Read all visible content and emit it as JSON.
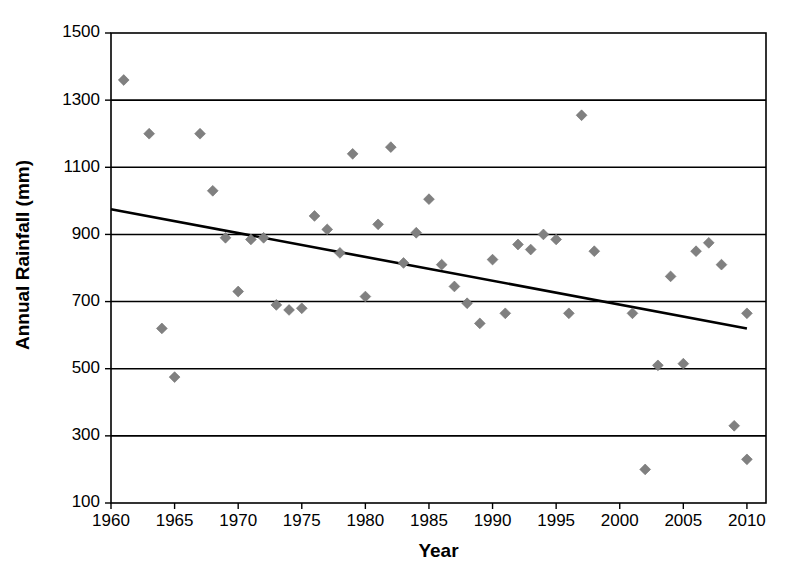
{
  "chart_data": {
    "type": "scatter",
    "title": "",
    "xlabel": "Year",
    "ylabel": "Annual Rainfall (mm)",
    "xlim": [
      1960,
      2011.5
    ],
    "ylim": [
      100,
      1500
    ],
    "xticks": [
      1960,
      1965,
      1970,
      1975,
      1980,
      1985,
      1990,
      1995,
      2000,
      2005,
      2010
    ],
    "yticks": [
      100,
      300,
      500,
      700,
      900,
      1100,
      1300,
      1500
    ],
    "xtick_labels": [
      "1960",
      "1965",
      "1970",
      "1975",
      "1980",
      "1985",
      "1990",
      "1995",
      "2000",
      "2005",
      "2010"
    ],
    "ytick_labels": [
      "100",
      "300",
      "500",
      "700",
      "900",
      "1100",
      "1300",
      "1500"
    ],
    "grid": "horizontal",
    "legend": "none",
    "marker_shape": "diamond",
    "marker_color": "#808080",
    "series": [
      {
        "name": "Annual Rainfall",
        "points": [
          [
            1961,
            1360
          ],
          [
            1963,
            1200
          ],
          [
            1964,
            620
          ],
          [
            1965,
            475
          ],
          [
            1967,
            1200
          ],
          [
            1968,
            1030
          ],
          [
            1969,
            890
          ],
          [
            1970,
            730
          ],
          [
            1971,
            885
          ],
          [
            1972,
            890
          ],
          [
            1973,
            690
          ],
          [
            1974,
            675
          ],
          [
            1975,
            680
          ],
          [
            1976,
            955
          ],
          [
            1977,
            915
          ],
          [
            1978,
            845
          ],
          [
            1979,
            1140
          ],
          [
            1980,
            715
          ],
          [
            1981,
            930
          ],
          [
            1982,
            1160
          ],
          [
            1983,
            815
          ],
          [
            1984,
            905
          ],
          [
            1985,
            1005
          ],
          [
            1986,
            810
          ],
          [
            1987,
            745
          ],
          [
            1988,
            695
          ],
          [
            1989,
            635
          ],
          [
            1990,
            825
          ],
          [
            1991,
            665
          ],
          [
            1992,
            870
          ],
          [
            1993,
            855
          ],
          [
            1994,
            900
          ],
          [
            1995,
            885
          ],
          [
            1996,
            665
          ],
          [
            1997,
            1255
          ],
          [
            1998,
            850
          ],
          [
            2001,
            665
          ],
          [
            2002,
            200
          ],
          [
            2003,
            510
          ],
          [
            2004,
            775
          ],
          [
            2005,
            515
          ],
          [
            2006,
            850
          ],
          [
            2007,
            875
          ],
          [
            2008,
            810
          ],
          [
            2009,
            330
          ],
          [
            2010,
            665
          ],
          [
            2010,
            230
          ]
        ]
      }
    ],
    "trendline": {
      "type": "linear",
      "x_start": 1960,
      "y_start": 975,
      "x_end": 2010,
      "y_end": 620,
      "description": "decreasing linear trend"
    }
  },
  "axes": {
    "y_title": "Annual Rainfall (mm)",
    "x_title": "Year"
  }
}
